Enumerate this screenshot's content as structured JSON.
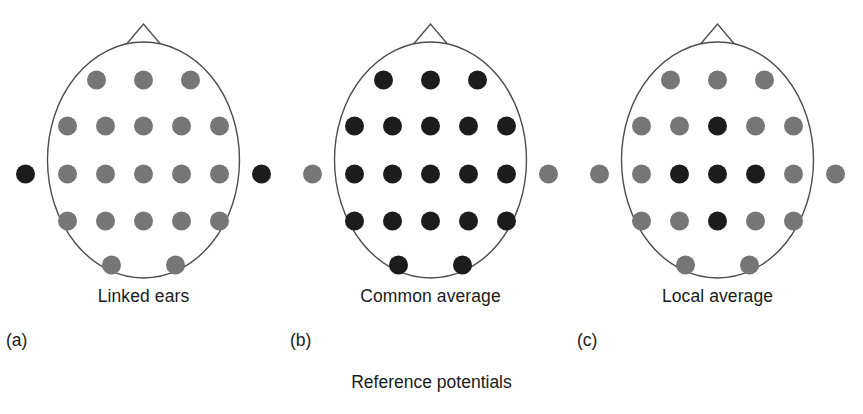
{
  "figure": {
    "caption": "Reference potentials",
    "head_outline_color": "#4d4d4d",
    "electrode_dark_color": "#1c1c1c",
    "electrode_gray_color": "#767676",
    "background_color": "#ffffff"
  },
  "geometry": {
    "head_center_x": 143,
    "head_center_y": 160,
    "head_radius_x": 96,
    "head_radius_y": 118,
    "electrode_radius": 9.5,
    "ear_offset_x": 118,
    "nose_half_width": 22,
    "nose_height": 26,
    "rows": [
      {
        "y": 80,
        "xs": [
          -47,
          0,
          47
        ]
      },
      {
        "y": 126,
        "xs": [
          -76,
          -38,
          0,
          38,
          76
        ]
      },
      {
        "y": 174,
        "xs": [
          -76,
          -38,
          0,
          38,
          76
        ]
      },
      {
        "y": 221,
        "xs": [
          -76,
          -38,
          0,
          38,
          76
        ]
      },
      {
        "y": 265,
        "xs": [
          -32,
          32
        ]
      }
    ]
  },
  "panels": [
    {
      "letter": "(a)",
      "caption": "Linked ears",
      "name": "linked-ears",
      "scalp_shades": [
        [
          "gray",
          "gray",
          "gray"
        ],
        [
          "gray",
          "gray",
          "gray",
          "gray",
          "gray"
        ],
        [
          "gray",
          "gray",
          "gray",
          "gray",
          "gray"
        ],
        [
          "gray",
          "gray",
          "gray",
          "gray",
          "gray"
        ],
        [
          "gray",
          "gray"
        ]
      ],
      "ear_shades": [
        "dark",
        "dark"
      ]
    },
    {
      "letter": "(b)",
      "caption": "Common average",
      "name": "common-average",
      "scalp_shades": [
        [
          "dark",
          "dark",
          "dark"
        ],
        [
          "dark",
          "dark",
          "dark",
          "dark",
          "dark"
        ],
        [
          "dark",
          "dark",
          "dark",
          "dark",
          "dark"
        ],
        [
          "dark",
          "dark",
          "dark",
          "dark",
          "dark"
        ],
        [
          "dark",
          "dark"
        ]
      ],
      "ear_shades": [
        "gray",
        "gray"
      ]
    },
    {
      "letter": "(c)",
      "caption": "Local average",
      "name": "local-average",
      "scalp_shades": [
        [
          "gray",
          "gray",
          "gray"
        ],
        [
          "gray",
          "gray",
          "dark",
          "gray",
          "gray"
        ],
        [
          "gray",
          "dark",
          "dark",
          "dark",
          "gray"
        ],
        [
          "gray",
          "gray",
          "dark",
          "gray",
          "gray"
        ],
        [
          "gray",
          "gray"
        ]
      ],
      "ear_shades": [
        "gray",
        "gray"
      ]
    }
  ]
}
